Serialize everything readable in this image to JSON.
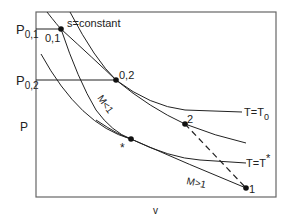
{
  "diagram": {
    "axes": {
      "x_label": "v",
      "y_label": "P"
    },
    "y_ticks": [
      {
        "main": "P",
        "sub": "0,1"
      },
      {
        "main": "P",
        "sub": "0,2"
      }
    ],
    "curve_labels": {
      "isentrope": "s=constant",
      "t0": {
        "main": "T=T",
        "sub": "0"
      },
      "tstar": {
        "main": "T=T",
        "sup": "*"
      },
      "subsonic": "M<1",
      "supersonic": "M>1"
    },
    "points": [
      {
        "id": "p01",
        "label": "0,1"
      },
      {
        "id": "p02",
        "label": "0,2"
      },
      {
        "id": "pstar",
        "label": "*"
      },
      {
        "id": "p2",
        "label": "2"
      },
      {
        "id": "p1",
        "label": "1"
      }
    ],
    "colors": {
      "line": "#222222",
      "frame": "#666666"
    }
  }
}
